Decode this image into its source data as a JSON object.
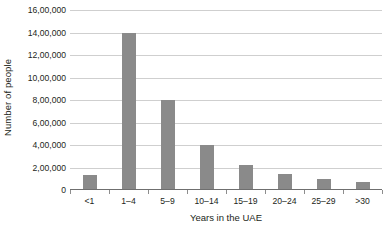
{
  "chart_data": {
    "type": "bar",
    "title": "",
    "subtitle": "",
    "xlabel": "Years in the UAE",
    "ylabel": "Number of people",
    "categories": [
      "<1",
      "1–4",
      "5–9",
      "10–14",
      "15–19",
      "20–24",
      "25–29",
      ">30"
    ],
    "values": [
      130000,
      1400000,
      800000,
      400000,
      220000,
      145000,
      95000,
      70000
    ],
    "series": [
      {
        "name": "Number of people",
        "values": [
          130000,
          1400000,
          800000,
          400000,
          220000,
          145000,
          95000,
          70000
        ]
      }
    ],
    "ylim": [
      0,
      1600000
    ],
    "ytick_values": [
      0,
      200000,
      400000,
      600000,
      800000,
      1000000,
      1200000,
      1400000,
      1600000
    ],
    "ytick_labels": [
      "0",
      "2,00,000",
      "4,00,000",
      "6,00,000",
      "8,00,000",
      "10,00,000",
      "12,00,000",
      "14,00,000",
      "16,00,000"
    ],
    "grid": true,
    "legend": false,
    "bar_color": "#8a8a8a",
    "gridline_color": "#cfcfcf",
    "axis_color": "#6f6f6f",
    "background_color": "#ffffff"
  }
}
